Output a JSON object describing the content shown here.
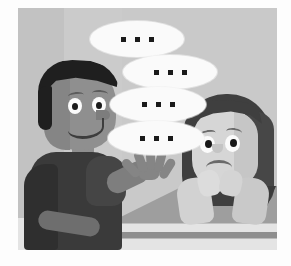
{
  "illustration": {
    "title": "Cartoon of a boy talking to a confused girl at a table",
    "alt": "A smiling boy gestures with his hand while four speech bubbles filled with ellipsis dots float toward a puzzled girl resting her chin on her hands at a table",
    "background_color": "#c9c9c9",
    "frame_color": "#fdfdfd"
  },
  "characters": {
    "boy": {
      "name": "boy-speaker",
      "expression": "smiling",
      "hair_color": "#1f1f1f",
      "skin_color": "#8f8f8f",
      "shirt_color": "#3a3a3a",
      "pose": "gesturing with open hand"
    },
    "girl": {
      "name": "girl-listener",
      "expression": "confused",
      "hair_color": "#3f3f3f",
      "skin_color": "#d6d6d6",
      "pose": "chin resting on clasped hands"
    }
  },
  "table": {
    "name": "table",
    "color": "#9e9e9e",
    "edge_color": "#8e8e8e"
  },
  "speech_bubbles": [
    {
      "id": "bubble-1",
      "text": "• • •",
      "dots": 3,
      "left": 72,
      "top": 13,
      "width": 94,
      "height": 36
    },
    {
      "id": "bubble-2",
      "text": "• • •",
      "dots": 3,
      "left": 105,
      "top": 47,
      "width": 94,
      "height": 34
    },
    {
      "id": "bubble-3",
      "text": "• • •",
      "dots": 3,
      "left": 92,
      "top": 79,
      "width": 96,
      "height": 35
    },
    {
      "id": "bubble-4",
      "text": "• • •",
      "dots": 3,
      "left": 90,
      "top": 113,
      "width": 96,
      "height": 34
    }
  ],
  "dot_color": "#1a1a1a",
  "bubble_color": "#fafafa"
}
